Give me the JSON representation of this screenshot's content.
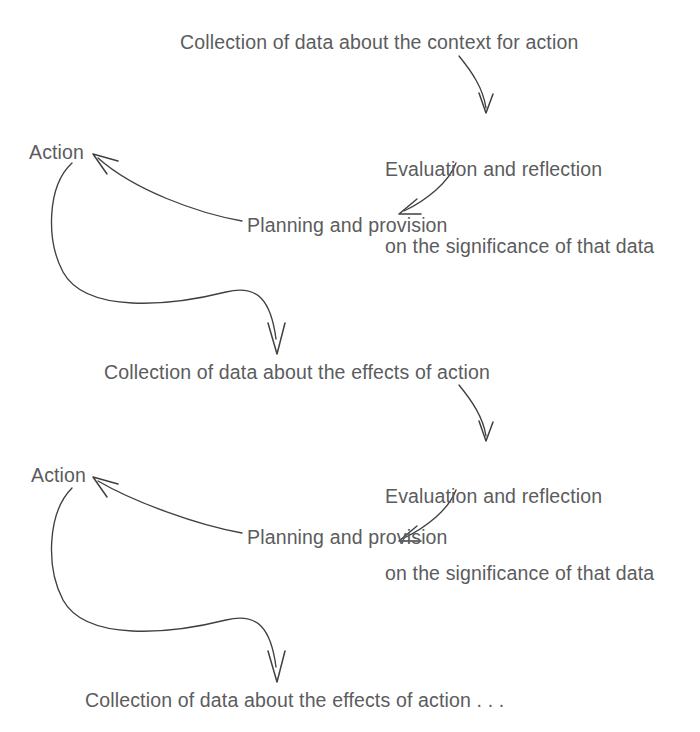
{
  "diagram": {
    "type": "cyclic-process-diagram",
    "text_color": "#5b5c5e",
    "stroke_color": "#3f4043",
    "background": "#ffffff",
    "nodes": [
      {
        "id": "n1",
        "label": "Collection of data about the context for action"
      },
      {
        "id": "n2",
        "label_line1": "Evaluation and reflection",
        "label_line2": "on the significance of that data"
      },
      {
        "id": "n3",
        "label": "Planning and provision"
      },
      {
        "id": "n4",
        "label": "Action"
      },
      {
        "id": "n5",
        "label": "Collection of data about the effects of action"
      },
      {
        "id": "n6",
        "label_line1": "Evaluation and reflection",
        "label_line2": "on the significance of that data"
      },
      {
        "id": "n7",
        "label": "Planning and provision"
      },
      {
        "id": "n8",
        "label": "Action"
      },
      {
        "id": "n9",
        "label": "Collection of data about the effects of action . . ."
      }
    ],
    "edges": [
      {
        "from": "n1",
        "to": "n2",
        "style": "curved-arrow-down"
      },
      {
        "from": "n2",
        "to": "n3",
        "style": "curved-arrow-down-left"
      },
      {
        "from": "n3",
        "to": "n4",
        "style": "curved-arrow-up-left"
      },
      {
        "from": "n4",
        "to": "n5",
        "style": "curved-s-arrow-down"
      },
      {
        "from": "n5",
        "to": "n6",
        "style": "curved-arrow-down"
      },
      {
        "from": "n6",
        "to": "n7",
        "style": "curved-arrow-down-left"
      },
      {
        "from": "n7",
        "to": "n8",
        "style": "curved-arrow-up-left"
      },
      {
        "from": "n8",
        "to": "n9",
        "style": "curved-s-arrow-down"
      }
    ]
  }
}
